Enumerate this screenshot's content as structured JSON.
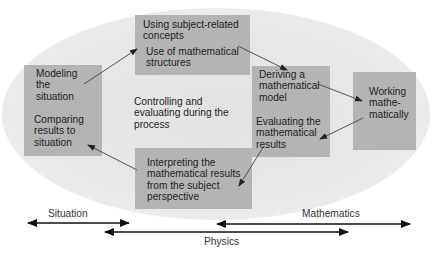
{
  "diagram": {
    "boxes": {
      "top": {
        "line1": [
          "Using subject-related",
          "concepts"
        ],
        "line2": [
          "Use of mathematical",
          "structures"
        ]
      },
      "left": {
        "line1": [
          "Modeling",
          "the",
          "situation"
        ],
        "line2": [
          "Comparing",
          "results to",
          "situation"
        ]
      },
      "center_right": {
        "line1": [
          "Deriving a",
          "mathematical",
          "model"
        ],
        "line2": [
          "Evaluating the",
          "mathematical",
          "results"
        ]
      },
      "far_right": {
        "line1": [
          "Working",
          "mathe-",
          "matically"
        ]
      },
      "bottom": {
        "line1": [
          "Interpreting the",
          "mathematical results",
          "from the subject",
          "perspective"
        ]
      }
    },
    "center_text": [
      "Controlling and",
      "evaluating during the",
      "process"
    ],
    "ranges": [
      {
        "label": "Situation"
      },
      {
        "label": "Mathematics"
      },
      {
        "label": "Physics"
      }
    ],
    "colors": {
      "box_fill": "#b4b4b4",
      "ellipse_fill": "#e6e6e6",
      "arrow": "#333333",
      "range_arrow": "#111111"
    }
  }
}
